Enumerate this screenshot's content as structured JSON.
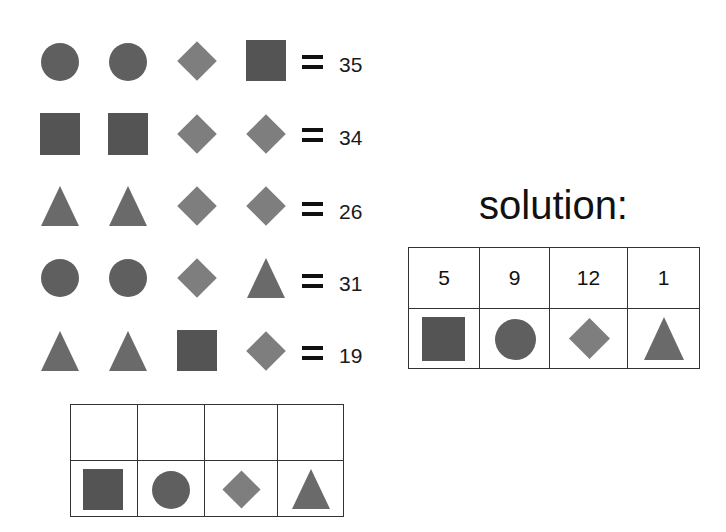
{
  "puzzle": {
    "rows": [
      {
        "shapes": [
          "circle",
          "circle",
          "diamond",
          "square"
        ],
        "equals": "=",
        "result": "35"
      },
      {
        "shapes": [
          "square",
          "square",
          "diamond",
          "diamond"
        ],
        "equals": "=",
        "result": "34"
      },
      {
        "shapes": [
          "triangle",
          "triangle",
          "diamond",
          "diamond"
        ],
        "equals": "=",
        "result": "26"
      },
      {
        "shapes": [
          "circle",
          "circle",
          "diamond",
          "triangle"
        ],
        "equals": "=",
        "result": "31"
      },
      {
        "shapes": [
          "triangle",
          "triangle",
          "square",
          "diamond"
        ],
        "equals": "=",
        "result": "19"
      }
    ]
  },
  "answer_grid": {
    "values": [
      "",
      "",
      "",
      ""
    ],
    "shapes": [
      "square",
      "circle",
      "diamond",
      "triangle"
    ]
  },
  "solution": {
    "title": "solution:",
    "values": [
      "5",
      "9",
      "12",
      "1"
    ],
    "shapes": [
      "square",
      "circle",
      "diamond",
      "triangle"
    ]
  },
  "colors": {
    "circle": "#5f5f5f",
    "square": "#545454",
    "diamond": "#7e7e7e",
    "triangle": "#6a6a6a"
  }
}
